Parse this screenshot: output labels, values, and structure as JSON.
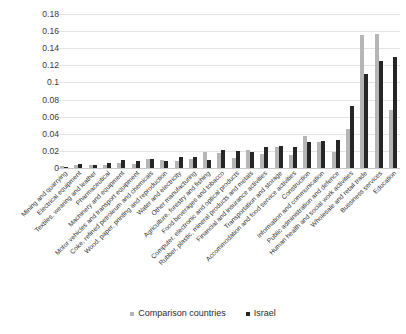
{
  "chart_data": {
    "type": "bar",
    "title": "",
    "subtitle": "",
    "xlabel": "",
    "ylabel": "",
    "ylim": [
      0,
      0.18
    ],
    "yticks": [
      "0",
      "0.02",
      "0.04",
      "0.06",
      "0.08",
      "0.1",
      "0.12",
      "0.14",
      "0.16",
      "0.18"
    ],
    "ytick_values": [
      0,
      0.02,
      0.04,
      0.06,
      0.08,
      0.1,
      0.12,
      0.14,
      0.16,
      0.18
    ],
    "grid": true,
    "legend_position": "bottom-center",
    "orientation": "vertical",
    "group_mode": "grouped",
    "categories": [
      "Mining and quarrying",
      "Electrical equipment",
      "Textiles, wearing and leather",
      "Pharmaceutical",
      "Machinery and equipment",
      "Motor vehicles and transport equipment",
      "Coke, refined petroleum and chemicals",
      "Wood, paper, printing and reproduction",
      "Water and electricity",
      "Other manufacturing",
      "Agriculture, forestry and fishing",
      "Food beverages and tobacco",
      "Computer, electronic and optical products",
      "Rubber, plastic, mineral products and metals",
      "Financial and insurance activities",
      "Transportation and storage",
      "Accommodation and food service activities",
      "Construction",
      "Information and communication",
      "Public administration and defence",
      "Human health and social work activities",
      "Wholesale and retail trade",
      "Bussiness services",
      "Education"
    ],
    "series": [
      {
        "name": "Comparison countries",
        "color": "#b6b6b6",
        "values": [
          0.002,
          0.004,
          0.003,
          0.004,
          0.006,
          0.005,
          0.01,
          0.009,
          0.008,
          0.011,
          0.019,
          0.017,
          0.012,
          0.021,
          0.016,
          0.024,
          0.015,
          0.037,
          0.03,
          0.019,
          0.046,
          0.155,
          0.157,
          0.068
        ]
      },
      {
        "name": "Israel",
        "color": "#262626",
        "values": [
          0.001,
          0.005,
          0.004,
          0.006,
          0.009,
          0.008,
          0.011,
          0.008,
          0.013,
          0.013,
          0.009,
          0.021,
          0.02,
          0.019,
          0.024,
          0.026,
          0.024,
          0.03,
          0.032,
          0.033,
          0.072,
          0.11,
          0.125,
          0.13
        ]
      }
    ]
  },
  "legend": {
    "items": [
      {
        "label": "Comparison countries",
        "marker": "comparison"
      },
      {
        "label": "Israel",
        "marker": "israel"
      }
    ]
  }
}
